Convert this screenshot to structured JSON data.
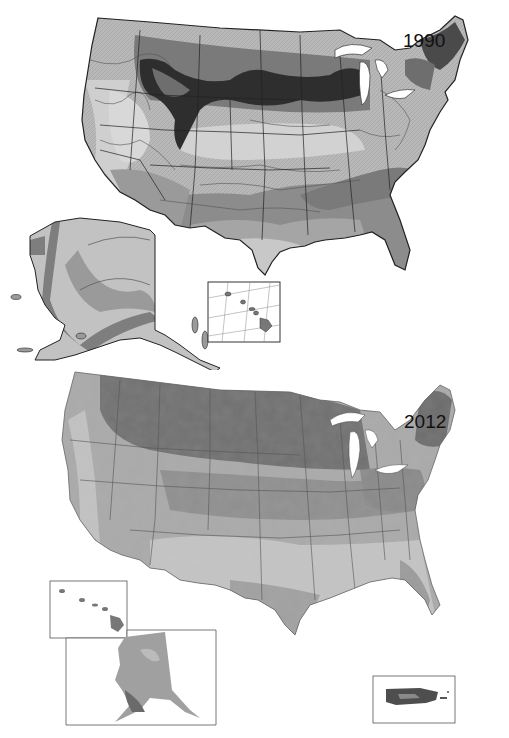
{
  "figure": {
    "maps": [
      {
        "year_label": "1990",
        "style": "contour-hatched grayscale",
        "insets": [
          "alaska",
          "hawaii"
        ]
      },
      {
        "year_label": "2012",
        "style": "smooth shaded grayscale",
        "insets": [
          "hawaii",
          "alaska",
          "puerto-rico"
        ]
      }
    ]
  },
  "palette": {
    "zone_darkest": "#2a2a2a",
    "zone_dark": "#5a5a5a",
    "zone_mid": "#7d7d7d",
    "zone_light": "#a8a8a8",
    "zone_lighter": "#c4c4c4",
    "zone_lightest": "#dedede",
    "border": "#333333",
    "water": "#ffffff"
  }
}
